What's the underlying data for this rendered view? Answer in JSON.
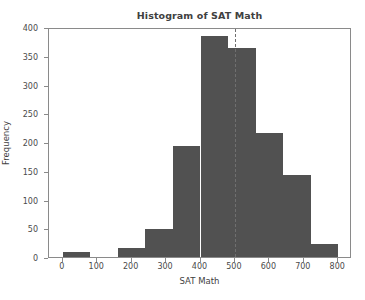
{
  "chart_data": {
    "type": "bar",
    "title": "Histogram of SAT Math",
    "xlabel": "SAT Math",
    "ylabel": "Frequency",
    "xlim": [
      -40,
      840
    ],
    "ylim": [
      0,
      400
    ],
    "grid": false,
    "legend": null,
    "bin_width": 80,
    "bin_edges": [
      0,
      80,
      160,
      240,
      320,
      400,
      480,
      560,
      640,
      720,
      800
    ],
    "categories": [
      "0-80",
      "80-160",
      "160-240",
      "240-320",
      "320-400",
      "400-480",
      "480-560",
      "560-640",
      "640-720",
      "720-800"
    ],
    "values": [
      8,
      0,
      15,
      48,
      193,
      385,
      363,
      215,
      143,
      23
    ],
    "xticks": [
      0,
      100,
      200,
      300,
      400,
      500,
      600,
      700,
      800
    ],
    "yticks": [
      0,
      50,
      100,
      150,
      200,
      250,
      300,
      350,
      400
    ],
    "xtick_labels": [
      "0",
      "100",
      "200",
      "300",
      "400",
      "500",
      "600",
      "700",
      "800"
    ],
    "ytick_labels": [
      "0",
      "50",
      "100",
      "150",
      "200",
      "250",
      "300",
      "350",
      "400"
    ],
    "annotations": [
      {
        "name": "mean-reference-line",
        "type": "vline",
        "x": 500,
        "style": "dashed",
        "color": "#6f6f6f"
      }
    ],
    "colors": {
      "bar": "#515151",
      "axis": "#8a8a8a",
      "text": "#3f3f3f",
      "refline": "#6f6f6f",
      "background": "#ffffff"
    }
  }
}
